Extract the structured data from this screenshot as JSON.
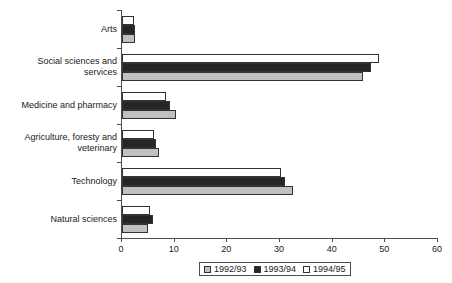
{
  "chart_data": {
    "type": "bar",
    "orientation": "horizontal",
    "title": "",
    "subtitle": "",
    "xlabel": "",
    "ylabel": "",
    "xlim": [
      0,
      60
    ],
    "xticks": [
      0,
      10,
      20,
      30,
      40,
      50,
      60
    ],
    "xtick_labels": [
      "0",
      "10",
      "20",
      "30",
      "40",
      "50",
      "60"
    ],
    "grid": false,
    "legend_position": "bottom",
    "categories": [
      "Arts",
      "Social sciences and services",
      "Medicine and pharmacy",
      "Agriculture, foresty and veterinary",
      "Technology",
      "Natural sciences"
    ],
    "category_labels": [
      [
        "Arts"
      ],
      [
        "Social sciences and",
        "services"
      ],
      [
        "Medicine and pharmacy"
      ],
      [
        "Agriculture, foresty and",
        "veterinary"
      ],
      [
        "Technology"
      ],
      [
        "Natural sciences"
      ]
    ],
    "series": [
      {
        "name": "1992/93",
        "color": "#c0c0c0",
        "values": [
          2.4,
          45.7,
          10.3,
          7.0,
          32.4,
          5.0
        ]
      },
      {
        "name": "1993/94",
        "color": "#262626",
        "values": [
          2.4,
          47.2,
          9.1,
          6.5,
          31.0,
          5.9
        ]
      },
      {
        "name": "1994/95",
        "color": "#ffffff",
        "values": [
          2.2,
          48.8,
          8.4,
          6.1,
          30.1,
          5.3
        ]
      }
    ]
  },
  "legend": {
    "items": [
      {
        "label": "1992/93",
        "series_key": "s-1992"
      },
      {
        "label": "1993/94",
        "series_key": "s-1993"
      },
      {
        "label": "1994/95",
        "series_key": "s-1994"
      }
    ]
  },
  "axis": {
    "x_tick_labels": [
      "0",
      "10",
      "20",
      "30",
      "40",
      "50",
      "60"
    ]
  }
}
